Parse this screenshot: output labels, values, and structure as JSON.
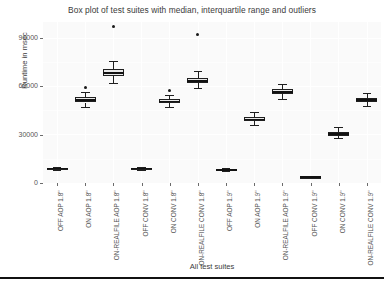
{
  "chart_data": {
    "type": "box",
    "title": "Box plot of test suites with median, interquartile range and outliers",
    "xlabel": "All test suites",
    "ylabel": "Runtime in msec",
    "ylim": [
      0,
      100000
    ],
    "yticks": [
      0,
      30000,
      60000,
      90000
    ],
    "ytick_labels": [
      "0",
      "30000",
      "60000",
      "90000"
    ],
    "grid": true,
    "legend": "none",
    "categories": [
      "OFF AOP 1.8\"",
      "ON AOP 1.8\"",
      "ON-REALFILE AOP 1.8\"",
      "OFF CONV 1.8\"",
      "ON CONV 1.8\"",
      "ON-REALFILE CONV 1.8\"",
      "OFF AOP 1.9\"",
      "ON AOP 1.9\"",
      "ON-REALFILE AOP 1.9\"",
      "OFF CONV 1.9\"",
      "ON CONV 1.9\"",
      "ON-REALFILE CONV 1.9\""
    ],
    "boxes": [
      {
        "category": "OFF AOP 1.8\"",
        "min": 8200,
        "q1": 8600,
        "median": 8900,
        "q3": 9300,
        "max": 10000,
        "outliers": []
      },
      {
        "category": "ON AOP 1.8\"",
        "min": 47000,
        "q1": 50000,
        "median": 51500,
        "q3": 53500,
        "max": 56500,
        "outliers": [
          59500
        ]
      },
      {
        "category": "ON-REALFILE AOP 1.8\"",
        "min": 62000,
        "q1": 66500,
        "median": 68500,
        "q3": 70500,
        "max": 75500,
        "outliers": [
          97500
        ]
      },
      {
        "category": "OFF CONV 1.8\"",
        "min": 8200,
        "q1": 8600,
        "median": 8900,
        "q3": 9300,
        "max": 10200,
        "outliers": []
      },
      {
        "category": "ON CONV 1.8\"",
        "min": 47000,
        "q1": 49500,
        "median": 50500,
        "q3": 52000,
        "max": 54500,
        "outliers": [
          57500
        ]
      },
      {
        "category": "ON-REALFILE CONV 1.8\"",
        "min": 59000,
        "q1": 62000,
        "median": 63500,
        "q3": 65500,
        "max": 69500,
        "outliers": [
          92500
        ]
      },
      {
        "category": "OFF AOP 1.9\"",
        "min": 7400,
        "q1": 7800,
        "median": 8100,
        "q3": 8500,
        "max": 9200,
        "outliers": []
      },
      {
        "category": "ON AOP 1.9\"",
        "min": 36000,
        "q1": 38500,
        "median": 39500,
        "q3": 41000,
        "max": 44000,
        "outliers": []
      },
      {
        "category": "ON-REALFILE AOP 1.9\"",
        "min": 52000,
        "q1": 55000,
        "median": 56500,
        "q3": 58500,
        "max": 61500,
        "outliers": []
      },
      {
        "category": "OFF CONV 1.9\"",
        "min": 3200,
        "q1": 3500,
        "median": 3700,
        "q3": 3900,
        "max": 4300,
        "outliers": []
      },
      {
        "category": "ON CONV 1.9\"",
        "min": 28000,
        "q1": 29500,
        "median": 30500,
        "q3": 31500,
        "max": 34500,
        "outliers": []
      },
      {
        "category": "ON-REALFILE CONV 1.9\"",
        "min": 48000,
        "q1": 50500,
        "median": 51500,
        "q3": 53000,
        "max": 56000,
        "outliers": []
      }
    ]
  },
  "style": {
    "panel_background": "#fafafa",
    "grid_color": "#ffffff",
    "box_fill": "#e9e9e9",
    "box_stroke": "#1f1f1f",
    "text_color": "#4d4d4d"
  }
}
